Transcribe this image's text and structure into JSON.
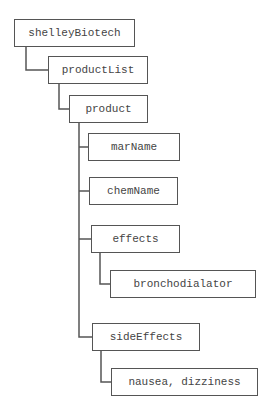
{
  "diagram": {
    "type": "tree",
    "nodes": [
      {
        "id": "root",
        "label": "shelleyBiotech",
        "parent": null
      },
      {
        "id": "productList",
        "label": "productList",
        "parent": "root"
      },
      {
        "id": "product",
        "label": "product",
        "parent": "productList"
      },
      {
        "id": "marName",
        "label": "marName",
        "parent": "product"
      },
      {
        "id": "chemName",
        "label": "chemName",
        "parent": "product"
      },
      {
        "id": "effects",
        "label": "effects",
        "parent": "product"
      },
      {
        "id": "bronchodialator",
        "label": "bronchodialator",
        "parent": "effects"
      },
      {
        "id": "sideEffects",
        "label": "sideEffects",
        "parent": "product"
      },
      {
        "id": "nauseaDizziness",
        "label": "nausea, dizziness",
        "parent": "sideEffects"
      }
    ],
    "colors": {
      "stroke": "#555555",
      "text": "#444444",
      "background": "#ffffff"
    }
  }
}
